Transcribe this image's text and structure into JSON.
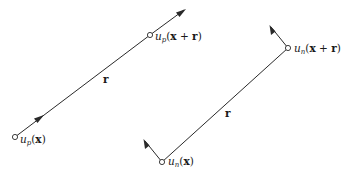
{
  "diagram": {
    "left_panel": {
      "description": "parallel velocity components u_p along separation r",
      "start_label": {
        "var": "u",
        "sub": "p",
        "open": "(",
        "arg": "x",
        "close": ")"
      },
      "end_label": {
        "var": "u",
        "sub": "p",
        "open": "(",
        "arg": "x",
        "plus": " + ",
        "arg2": "r",
        "close": ")"
      },
      "separation_label": "r"
    },
    "right_panel": {
      "description": "normal velocity components u_n perpendicular to separation r",
      "start_label": {
        "var": "u",
        "sub": "n",
        "open": "(",
        "arg": "x",
        "close": ")"
      },
      "end_label": {
        "var": "u",
        "sub": "n",
        "open": "(",
        "arg": "x",
        "plus": " + ",
        "arg2": "r",
        "close": ")"
      },
      "separation_label": "r"
    }
  }
}
